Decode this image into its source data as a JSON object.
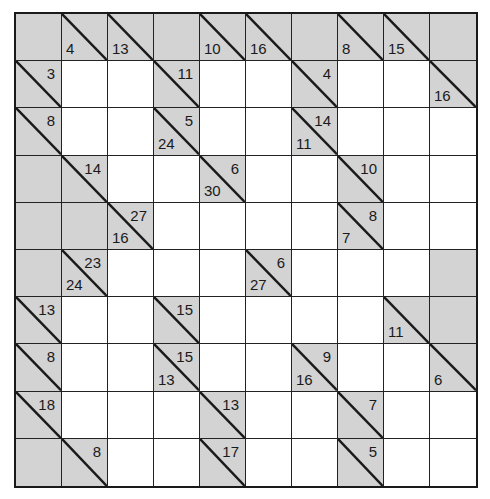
{
  "puzzle": {
    "type": "kakuro",
    "rows": 10,
    "cols": 10,
    "colors": {
      "clue_cell": "#d3d3d3",
      "entry_cell": "#ffffff",
      "grid_line": "#1a1a1a"
    },
    "cells": [
      [
        {
          "t": "b"
        },
        {
          "t": "c",
          "down": "4"
        },
        {
          "t": "c",
          "down": "13"
        },
        {
          "t": "b"
        },
        {
          "t": "c",
          "down": "10"
        },
        {
          "t": "c",
          "down": "16"
        },
        {
          "t": "b"
        },
        {
          "t": "c",
          "down": "8"
        },
        {
          "t": "c",
          "down": "15"
        },
        {
          "t": "b"
        }
      ],
      [
        {
          "t": "c",
          "across": "3"
        },
        {
          "t": "w"
        },
        {
          "t": "w"
        },
        {
          "t": "c",
          "across": "11"
        },
        {
          "t": "w"
        },
        {
          "t": "w"
        },
        {
          "t": "c",
          "across": "4"
        },
        {
          "t": "w"
        },
        {
          "t": "w"
        },
        {
          "t": "c",
          "down": "16"
        }
      ],
      [
        {
          "t": "c",
          "across": "8"
        },
        {
          "t": "w"
        },
        {
          "t": "w"
        },
        {
          "t": "c",
          "across": "5",
          "down": "24"
        },
        {
          "t": "w"
        },
        {
          "t": "w"
        },
        {
          "t": "c",
          "across": "14",
          "down": "11"
        },
        {
          "t": "w"
        },
        {
          "t": "w"
        },
        {
          "t": "w"
        }
      ],
      [
        {
          "t": "b"
        },
        {
          "t": "c",
          "across": "14"
        },
        {
          "t": "w"
        },
        {
          "t": "w"
        },
        {
          "t": "c",
          "across": "6",
          "down": "30"
        },
        {
          "t": "w"
        },
        {
          "t": "w"
        },
        {
          "t": "c",
          "across": "10"
        },
        {
          "t": "w"
        },
        {
          "t": "w"
        }
      ],
      [
        {
          "t": "b"
        },
        {
          "t": "b"
        },
        {
          "t": "c",
          "across": "27",
          "down": "16"
        },
        {
          "t": "w"
        },
        {
          "t": "w"
        },
        {
          "t": "w"
        },
        {
          "t": "w"
        },
        {
          "t": "c",
          "across": "8",
          "down": "7"
        },
        {
          "t": "w"
        },
        {
          "t": "w"
        }
      ],
      [
        {
          "t": "b"
        },
        {
          "t": "c",
          "across": "23",
          "down": "24"
        },
        {
          "t": "w"
        },
        {
          "t": "w"
        },
        {
          "t": "w"
        },
        {
          "t": "c",
          "across": "6",
          "down": "27"
        },
        {
          "t": "w"
        },
        {
          "t": "w"
        },
        {
          "t": "w"
        },
        {
          "t": "b"
        }
      ],
      [
        {
          "t": "c",
          "across": "13"
        },
        {
          "t": "w"
        },
        {
          "t": "w"
        },
        {
          "t": "c",
          "across": "15"
        },
        {
          "t": "w"
        },
        {
          "t": "w"
        },
        {
          "t": "w"
        },
        {
          "t": "w"
        },
        {
          "t": "c",
          "down": "11"
        },
        {
          "t": "b"
        }
      ],
      [
        {
          "t": "c",
          "across": "8"
        },
        {
          "t": "w"
        },
        {
          "t": "w"
        },
        {
          "t": "c",
          "across": "15",
          "down": "13"
        },
        {
          "t": "w"
        },
        {
          "t": "w"
        },
        {
          "t": "c",
          "across": "9",
          "down": "16"
        },
        {
          "t": "w"
        },
        {
          "t": "w"
        },
        {
          "t": "c",
          "down": "6"
        }
      ],
      [
        {
          "t": "c",
          "across": "18"
        },
        {
          "t": "w"
        },
        {
          "t": "w"
        },
        {
          "t": "w"
        },
        {
          "t": "c",
          "across": "13"
        },
        {
          "t": "w"
        },
        {
          "t": "w"
        },
        {
          "t": "c",
          "across": "7"
        },
        {
          "t": "w"
        },
        {
          "t": "w"
        }
      ],
      [
        {
          "t": "b"
        },
        {
          "t": "c",
          "across": "8"
        },
        {
          "t": "w"
        },
        {
          "t": "w"
        },
        {
          "t": "c",
          "across": "17"
        },
        {
          "t": "w"
        },
        {
          "t": "w"
        },
        {
          "t": "c",
          "across": "5"
        },
        {
          "t": "w"
        },
        {
          "t": "w"
        }
      ]
    ]
  }
}
